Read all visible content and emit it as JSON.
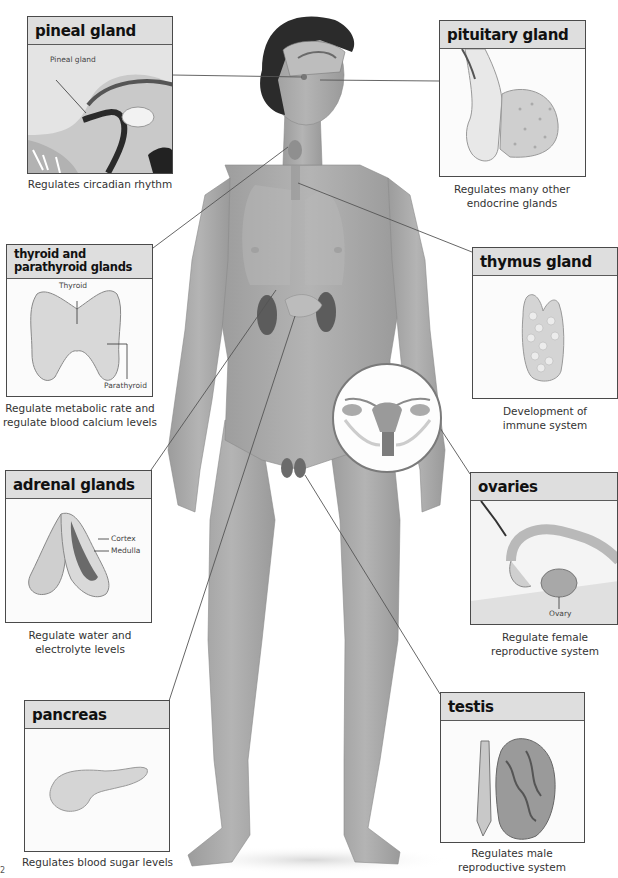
{
  "figure": {
    "central_image": "male-body-illustration",
    "inset": "female-reproductive-organs-inset"
  },
  "glands": {
    "pineal": {
      "title": "pineal gland",
      "caption": "Regulates circadian rhythm",
      "labels": {
        "pineal": "Pineal gland"
      }
    },
    "pituitary": {
      "title": "pituitary gland",
      "caption_line1": "Regulates many other",
      "caption_line2": "endocrine glands"
    },
    "thyroid": {
      "title_line1": "thyroid and",
      "title_line2": "parathyroid glands",
      "caption_line1": "Regulate metabolic rate and",
      "caption_line2": "regulate blood calcium levels",
      "labels": {
        "thyroid": "Thyroid",
        "parathyroid": "Parathyroid"
      }
    },
    "thymus": {
      "title": "thymus gland",
      "caption_line1": "Development of",
      "caption_line2": "immune system"
    },
    "adrenal": {
      "title": "adrenal glands",
      "caption_line1": "Regulate water and",
      "caption_line2": "electrolyte levels",
      "labels": {
        "cortex": "Cortex",
        "medulla": "Medulla"
      }
    },
    "ovaries": {
      "title": "ovaries",
      "caption_line1": "Regulate female",
      "caption_line2": "reproductive system",
      "labels": {
        "ovary": "Ovary"
      }
    },
    "pancreas": {
      "title": "pancreas",
      "caption": "Regulates blood sugar levels"
    },
    "testis": {
      "title": "testis",
      "caption_line1": "Regulates male",
      "caption_line2": "reproductive system"
    }
  },
  "page_mark": "2",
  "colors": {
    "header_bg": "#dedede",
    "border": "#4a4a4a",
    "skin": "#a9a9a9",
    "organ_dark": "#5e5e5e"
  }
}
